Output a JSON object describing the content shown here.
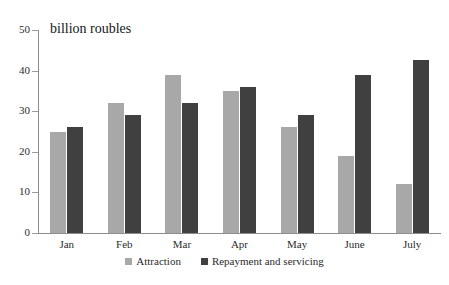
{
  "chart_data": {
    "type": "bar",
    "title": "billion roubles",
    "xlabel": "",
    "ylabel": "billion roubles",
    "ylim": [
      0,
      50
    ],
    "yticks": [
      0,
      10,
      20,
      30,
      40,
      50
    ],
    "grid": false,
    "legend_position": "bottom-center",
    "categories": [
      "Jan",
      "Feb",
      "Mar",
      "Apr",
      "May",
      "June",
      "July"
    ],
    "series": [
      {
        "name": "Attraction",
        "color": "#a8a8a8",
        "values": [
          25,
          32,
          39,
          35,
          26,
          19,
          12
        ]
      },
      {
        "name": "Repayment and servicing",
        "color": "#404040",
        "values": [
          26,
          29,
          32,
          36,
          29,
          39,
          42.5
        ]
      }
    ]
  },
  "axis": {
    "y_tick_labels": [
      "50",
      "40",
      "30",
      "20",
      "10",
      "0"
    ]
  },
  "colors": {
    "attraction": "#a8a8a8",
    "repayment": "#404040",
    "axis": "#8d8d8d",
    "text": "#2b2b2b",
    "background": "#ffffff"
  }
}
